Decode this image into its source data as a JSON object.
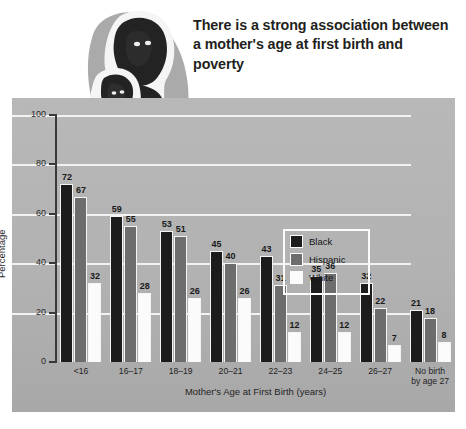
{
  "header": {
    "title": "There is a strong association between a mother's age at first birth and poverty"
  },
  "illustration": {
    "name": "mother-and-child-illustration"
  },
  "legend": {
    "items": [
      {
        "label": "Black",
        "color": "#1c1c1c"
      },
      {
        "label": "Hispanic",
        "color": "#6d6d6d"
      },
      {
        "label": "White",
        "color": "#fbfbfb"
      }
    ]
  },
  "axes": {
    "y_title": "Percentage",
    "x_title": "Mother's Age at First Birth (years)",
    "y_ticks": [
      "0",
      "20",
      "40",
      "60",
      "80",
      "100"
    ]
  },
  "chart_data": {
    "type": "bar",
    "title": "There is a strong association between a mother's age at first birth and poverty",
    "xlabel": "Mother's Age at First Birth (years)",
    "ylabel": "Percentage",
    "ylim": [
      0,
      100
    ],
    "yticks": [
      0,
      20,
      40,
      60,
      80,
      100
    ],
    "grid": true,
    "legend_position": "inside-top-right",
    "categories": [
      "<16",
      "16–17",
      "18–19",
      "20–21",
      "22–23",
      "24–25",
      "26–27",
      "No birth by age 27"
    ],
    "category_labels": [
      [
        "<16"
      ],
      [
        "16–17"
      ],
      [
        "18–19"
      ],
      [
        "20–21"
      ],
      [
        "22–23"
      ],
      [
        "24–25"
      ],
      [
        "26–27"
      ],
      [
        "No birth",
        "by age 27"
      ]
    ],
    "series": [
      {
        "name": "Black",
        "color": "#1c1c1c",
        "values": [
          72,
          59,
          53,
          45,
          43,
          35,
          32,
          21
        ]
      },
      {
        "name": "Hispanic",
        "color": "#6d6d6d",
        "values": [
          67,
          55,
          51,
          40,
          31,
          36,
          22,
          18
        ]
      },
      {
        "name": "White",
        "color": "#fbfbfb",
        "values": [
          32,
          28,
          26,
          26,
          12,
          12,
          7,
          8
        ]
      }
    ]
  }
}
